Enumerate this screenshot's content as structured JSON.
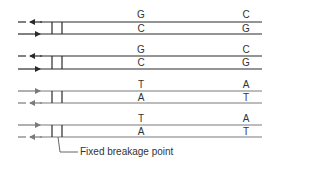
{
  "diagram": {
    "title": "",
    "caption": "Fixed breakage point",
    "colors": {
      "dark": "#2a2a2a",
      "gray": "#7a7a7a"
    },
    "duplexes": [
      {
        "id": 1,
        "color": "dark",
        "top_y": 22,
        "bottom_y": 34,
        "top_arrow": "left",
        "bottom_arrow": "right",
        "pair1": {
          "top": "G",
          "bottom": "C"
        },
        "pair2": {
          "top": "C",
          "bottom": "G"
        }
      },
      {
        "id": 2,
        "color": "dark",
        "top_y": 56,
        "bottom_y": 69,
        "top_arrow": "left",
        "bottom_arrow": "right",
        "pair1": {
          "top": "G",
          "bottom": "C"
        },
        "pair2": {
          "top": "C",
          "bottom": "G"
        }
      },
      {
        "id": 3,
        "color": "gray",
        "top_y": 91,
        "bottom_y": 103,
        "top_arrow": "right",
        "bottom_arrow": "left",
        "pair1": {
          "top": "T",
          "bottom": "A"
        },
        "pair2": {
          "top": "A",
          "bottom": "T"
        }
      },
      {
        "id": 4,
        "color": "gray",
        "top_y": 125,
        "bottom_y": 137,
        "top_arrow": "right",
        "bottom_arrow": "left",
        "pair1": {
          "top": "T",
          "bottom": "A"
        },
        "pair2": {
          "top": "A",
          "bottom": "T"
        }
      }
    ]
  }
}
